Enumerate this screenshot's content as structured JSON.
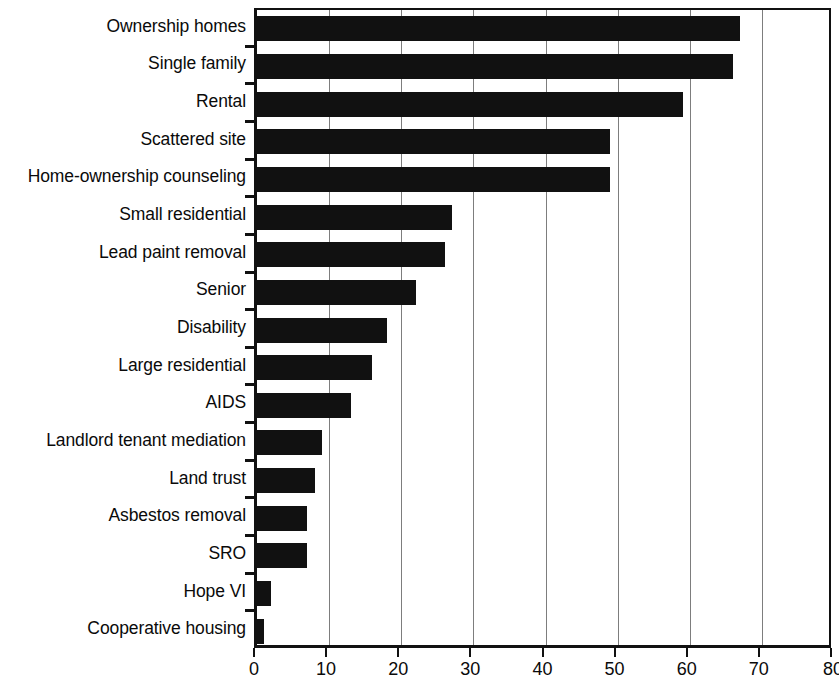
{
  "chart_data": {
    "type": "bar",
    "orientation": "horizontal",
    "title": "",
    "subtitle": "",
    "xlabel": "",
    "ylabel": "",
    "xlim": [
      0,
      80
    ],
    "ylim": null,
    "grid": true,
    "grid_axis": "x",
    "legend": false,
    "legend_position": "none",
    "bar_color": "#111111",
    "axis_color": "#111111",
    "gridline_color": "#7d7d7d",
    "background_color": "#ffffff",
    "xticks": [
      0,
      10,
      20,
      30,
      40,
      50,
      60,
      70,
      80
    ],
    "xticklabels": [
      "0",
      "10",
      "20",
      "30",
      "40",
      "50",
      "60",
      "70",
      "80"
    ],
    "categories": [
      "Ownership homes",
      "Single family",
      "Rental",
      "Scattered site",
      "Home-ownership counseling",
      "Small residential",
      "Lead paint removal",
      "Senior",
      "Disability",
      "Large residential",
      "AIDS",
      "Landlord tenant mediation",
      "Land trust",
      "Asbestos removal",
      "SRO",
      "Hope VI",
      "Cooperative housing"
    ],
    "values": [
      67,
      66,
      59,
      49,
      49,
      27,
      26,
      22,
      18,
      16,
      13,
      9,
      8,
      7,
      7,
      2,
      1
    ],
    "annotations": []
  }
}
